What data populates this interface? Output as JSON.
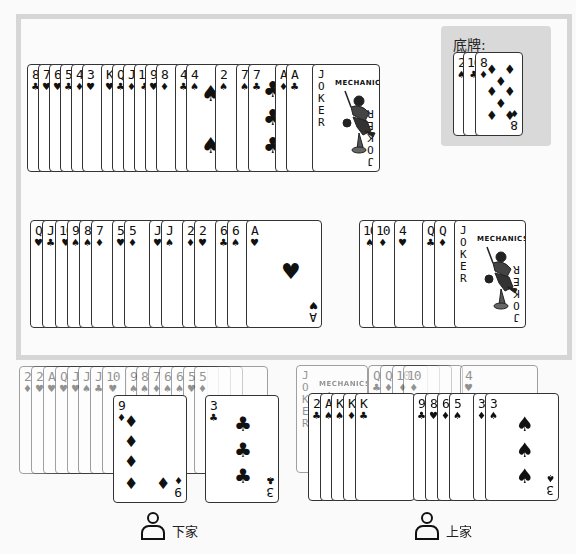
{
  "bottom_cards": {
    "title": "底牌:",
    "cards": [
      {
        "rank": "2",
        "suit": "♠"
      },
      {
        "rank": "10",
        "suit": "♣"
      },
      {
        "rank": "8",
        "suit": "♦"
      }
    ]
  },
  "played_row_1": {
    "cards": [
      {
        "rank": "8",
        "suit": "♣"
      },
      {
        "rank": "7",
        "suit": "♥"
      },
      {
        "rank": "6",
        "suit": "♥"
      },
      {
        "rank": "5",
        "suit": "♣"
      },
      {
        "rank": "4",
        "suit": "♦"
      },
      {
        "rank": "3",
        "suit": "♥"
      },
      {
        "rank": "K",
        "suit": "♥"
      },
      {
        "rank": "Q",
        "suit": "♣"
      },
      {
        "rank": "J",
        "suit": "♦"
      },
      {
        "rank": "10",
        "suit": "♣"
      },
      {
        "rank": "9",
        "suit": "♥"
      },
      {
        "rank": "8",
        "suit": "♦"
      },
      {
        "rank": "4",
        "suit": "♣"
      },
      {
        "rank": "4",
        "suit": "♠"
      },
      {
        "rank": "2",
        "suit": "♠"
      },
      {
        "rank": "7",
        "suit": "♠"
      },
      {
        "rank": "7",
        "suit": "♣"
      },
      {
        "rank": "A",
        "suit": "♦"
      },
      {
        "rank": "A",
        "suit": "♣"
      },
      {
        "rank": "JOKER",
        "suit": ""
      }
    ]
  },
  "played_row_2_left": {
    "cards": [
      {
        "rank": "Q",
        "suit": "♥"
      },
      {
        "rank": "J",
        "suit": "♣"
      },
      {
        "rank": "10",
        "suit": "♥"
      },
      {
        "rank": "9",
        "suit": "♠"
      },
      {
        "rank": "8",
        "suit": "♠"
      },
      {
        "rank": "7",
        "suit": "♦"
      },
      {
        "rank": "5",
        "suit": "♥"
      },
      {
        "rank": "5",
        "suit": "♦"
      },
      {
        "rank": "J",
        "suit": "♥"
      },
      {
        "rank": "J",
        "suit": "♠"
      },
      {
        "rank": "2",
        "suit": "♦"
      },
      {
        "rank": "2",
        "suit": "♥"
      },
      {
        "rank": "6",
        "suit": "♣"
      },
      {
        "rank": "6",
        "suit": "♠"
      },
      {
        "rank": "A",
        "suit": "♥"
      }
    ]
  },
  "played_row_2_right": {
    "cards": [
      {
        "rank": "10",
        "suit": "♠"
      },
      {
        "rank": "10",
        "suit": "♦"
      },
      {
        "rank": "4",
        "suit": "♥"
      },
      {
        "rank": "Q",
        "suit": "♣"
      },
      {
        "rank": "Q",
        "suit": "♦"
      },
      {
        "rank": "JOKER",
        "suit": ""
      }
    ]
  },
  "players": {
    "next": {
      "label": "下家",
      "faded_hand": [
        {
          "rank": "2",
          "suit": "♦"
        },
        {
          "rank": "2",
          "suit": "♥"
        },
        {
          "rank": "A",
          "suit": "♥"
        },
        {
          "rank": "Q",
          "suit": "♥"
        },
        {
          "rank": "J",
          "suit": "♥"
        },
        {
          "rank": "J",
          "suit": "♠"
        },
        {
          "rank": "J",
          "suit": "♣"
        },
        {
          "rank": "10",
          "suit": "♥"
        },
        {
          "rank": "9",
          "suit": "♠"
        },
        {
          "rank": "8",
          "suit": "♠"
        },
        {
          "rank": "7",
          "suit": "♦"
        },
        {
          "rank": "6",
          "suit": "♠"
        },
        {
          "rank": "6",
          "suit": "♠"
        },
        {
          "rank": "5",
          "suit": "♥"
        },
        {
          "rank": "5",
          "suit": "♦"
        }
      ],
      "played": [
        {
          "rank": "9",
          "suit": "♦"
        },
        {
          "rank": "3",
          "suit": "♣"
        }
      ]
    },
    "prev": {
      "label": "上家",
      "faded_hand": [
        {
          "rank": "JOKER",
          "suit": ""
        },
        {
          "rank": "Q",
          "suit": "♣"
        },
        {
          "rank": "Q",
          "suit": "♦"
        },
        {
          "rank": "10",
          "suit": "♦"
        },
        {
          "rank": "10",
          "suit": "♦"
        },
        {
          "rank": "4",
          "suit": "♥"
        }
      ],
      "played": [
        {
          "rank": "2",
          "suit": "♣"
        },
        {
          "rank": "A",
          "suit": "♠"
        },
        {
          "rank": "K",
          "suit": "♠"
        },
        {
          "rank": "K",
          "suit": "♦"
        },
        {
          "rank": "K",
          "suit": "♣"
        },
        {
          "rank": "9",
          "suit": "♣"
        },
        {
          "rank": "8",
          "suit": "♥"
        },
        {
          "rank": "6",
          "suit": "♦"
        },
        {
          "rank": "5",
          "suit": "♠"
        },
        {
          "rank": "3",
          "suit": "♦"
        },
        {
          "rank": "3",
          "suit": "♠"
        }
      ]
    }
  },
  "joker": {
    "text": "JOKER",
    "brand": "MECHANICS"
  },
  "colors": {
    "table_border": "#d6d6d6",
    "panel_bg": "#d9d9d9",
    "card_border": "#333333",
    "background": "#fafafa"
  }
}
